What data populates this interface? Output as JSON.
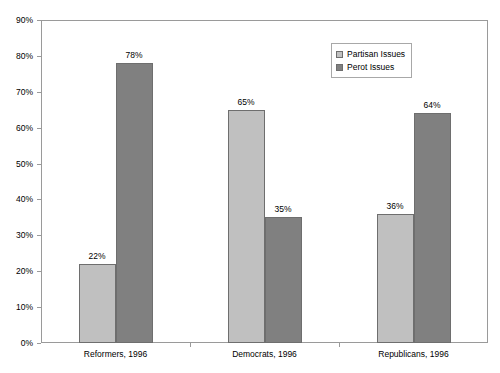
{
  "chart_data": {
    "type": "bar",
    "title": "",
    "subtitle": "",
    "xlabel": "",
    "ylabel": "",
    "categories": [
      "Reformers, 1996",
      "Democrats, 1996",
      "Republicans, 1996"
    ],
    "series": [
      {
        "name": "Partisan Issues",
        "color": "#C0C0C0",
        "values": [
          22,
          65,
          36
        ],
        "labels": [
          "22%",
          "65%",
          "36%"
        ]
      },
      {
        "name": "Perot Issues",
        "color": "#808080",
        "values": [
          78,
          35,
          64
        ],
        "labels": [
          "78%",
          "35%",
          "64%"
        ]
      }
    ],
    "ylim": [
      0,
      90
    ],
    "ytick_values": [
      0,
      10,
      20,
      30,
      40,
      50,
      60,
      70,
      80,
      90
    ],
    "ytick_labels": [
      "0%",
      "10%",
      "20%",
      "30%",
      "40%",
      "50%",
      "60%",
      "70%",
      "80%",
      "90%"
    ],
    "grid": false,
    "legend_position": "upper-right-inside",
    "value_labels_shown": true
  },
  "legend": {
    "entries": [
      {
        "label": "Partisan Issues",
        "color": "#C0C0C0"
      },
      {
        "label": "Perot Issues",
        "color": "#808080"
      }
    ]
  },
  "axes": {
    "y_tick_labels": [
      "90%",
      "80%",
      "70%",
      "60%",
      "50%",
      "40%",
      "30%",
      "20%",
      "10%",
      "0%"
    ],
    "x_category_labels": [
      "Reformers, 1996",
      "Democrats, 1996",
      "Republicans, 1996"
    ]
  }
}
